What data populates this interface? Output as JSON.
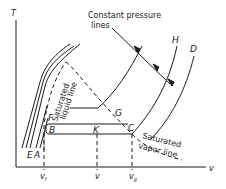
{
  "diagram": {
    "axes": {
      "y_label": "T",
      "x_label": "v",
      "x_ticks": [
        {
          "label": "v",
          "sub": "f"
        },
        {
          "label": "v",
          "sub": ""
        },
        {
          "label": "v",
          "sub": "g"
        }
      ]
    },
    "annotations": {
      "constant_pressure_line1": "Constant pressure",
      "constant_pressure_line2": "lines",
      "sat_liquid_1": "Saturated",
      "sat_liquid_2": "liquid line",
      "sat_vapor_1": "Saturated",
      "sat_vapor_2": "vapor line"
    },
    "points": {
      "A": "A",
      "E": "E",
      "B": "B",
      "F": "F",
      "K": "K",
      "G": "G",
      "C": "C",
      "H": "H",
      "D": "D"
    },
    "colors": {
      "ink": "#1a1a1a",
      "background": "#ffffff"
    }
  }
}
